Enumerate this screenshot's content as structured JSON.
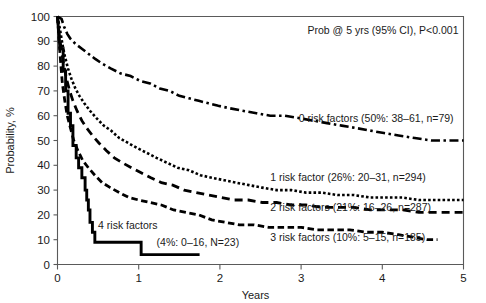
{
  "chart_data": {
    "type": "line",
    "title": "",
    "subtitle": "",
    "annotation_header": "Prob @ 5 yrs (95% CI), P<0.001",
    "xlabel": "Years",
    "ylabel": "Probability, %",
    "xlim": [
      0,
      5
    ],
    "ylim": [
      0,
      100
    ],
    "xticks": [
      "0",
      "1",
      "2",
      "3",
      "4",
      "5"
    ],
    "xtick_values": [
      0,
      1,
      2,
      3,
      4,
      5
    ],
    "yticks": [
      "0",
      "10",
      "20",
      "30",
      "40",
      "50",
      "60",
      "70",
      "80",
      "90",
      "100"
    ],
    "ytick_values": [
      0,
      10,
      20,
      30,
      40,
      50,
      60,
      70,
      80,
      90,
      100
    ],
    "grid": false,
    "legend_position": "inline-annotations",
    "series": [
      {
        "name": "0 risk factors",
        "label": "0 risk factors (50%: 38–61, n=79)",
        "prob_5yr": 50,
        "ci_low": 38,
        "ci_high": 61,
        "n": 79,
        "linestyle": "dashdot",
        "dasharray": "9,3.5,2.5,3.5",
        "linewidth": 2.6,
        "label_x": 2.97,
        "label_y": 57.5,
        "points": [
          [
            0.0,
            100
          ],
          [
            0.05,
            99
          ],
          [
            0.08,
            96
          ],
          [
            0.12,
            93
          ],
          [
            0.16,
            91
          ],
          [
            0.22,
            89
          ],
          [
            0.3,
            87
          ],
          [
            0.38,
            85
          ],
          [
            0.46,
            83
          ],
          [
            0.55,
            81
          ],
          [
            0.66,
            79
          ],
          [
            0.78,
            77
          ],
          [
            0.9,
            76
          ],
          [
            1.02,
            74
          ],
          [
            1.14,
            73
          ],
          [
            1.26,
            71
          ],
          [
            1.38,
            70
          ],
          [
            1.5,
            68
          ],
          [
            1.62,
            67
          ],
          [
            1.74,
            66
          ],
          [
            1.86,
            65
          ],
          [
            1.98,
            64
          ],
          [
            2.12,
            63
          ],
          [
            2.28,
            62
          ],
          [
            2.45,
            61
          ],
          [
            2.62,
            60
          ],
          [
            2.8,
            60
          ],
          [
            2.98,
            59
          ],
          [
            3.15,
            58
          ],
          [
            3.32,
            57
          ],
          [
            3.5,
            56
          ],
          [
            3.68,
            55
          ],
          [
            3.85,
            54
          ],
          [
            4.02,
            53
          ],
          [
            4.2,
            52
          ],
          [
            4.4,
            51
          ],
          [
            4.6,
            50
          ],
          [
            4.8,
            50
          ],
          [
            5.0,
            50
          ]
        ]
      },
      {
        "name": "1 risk factor",
        "label": "1 risk factor (26%: 20–31, n=294)",
        "prob_5yr": 26,
        "ci_low": 20,
        "ci_high": 31,
        "n": 294,
        "linestyle": "dotted",
        "dasharray": "2.6,2.2",
        "linewidth": 2.6,
        "label_x": 2.62,
        "label_y": 33.5,
        "points": [
          [
            0.0,
            100
          ],
          [
            0.03,
            95
          ],
          [
            0.06,
            89
          ],
          [
            0.09,
            84
          ],
          [
            0.13,
            79
          ],
          [
            0.17,
            75
          ],
          [
            0.22,
            71
          ],
          [
            0.27,
            68
          ],
          [
            0.33,
            65
          ],
          [
            0.4,
            62
          ],
          [
            0.48,
            59
          ],
          [
            0.57,
            56
          ],
          [
            0.66,
            54
          ],
          [
            0.76,
            51
          ],
          [
            0.87,
            49
          ],
          [
            0.98,
            47
          ],
          [
            1.1,
            45
          ],
          [
            1.22,
            43
          ],
          [
            1.35,
            41
          ],
          [
            1.48,
            39
          ],
          [
            1.62,
            38
          ],
          [
            1.76,
            36
          ],
          [
            1.9,
            35
          ],
          [
            2.05,
            34
          ],
          [
            2.2,
            33
          ],
          [
            2.36,
            32
          ],
          [
            2.52,
            31
          ],
          [
            2.7,
            30
          ],
          [
            2.88,
            30
          ],
          [
            3.06,
            29
          ],
          [
            3.25,
            29
          ],
          [
            3.45,
            28
          ],
          [
            3.65,
            28
          ],
          [
            3.85,
            27
          ],
          [
            4.05,
            27
          ],
          [
            4.25,
            27
          ],
          [
            4.45,
            26
          ],
          [
            4.65,
            26
          ],
          [
            4.85,
            26
          ],
          [
            5.0,
            26
          ]
        ]
      },
      {
        "name": "2 risk factors",
        "label": "2 risk factors (21%: 16–26, n=287)",
        "prob_5yr": 21,
        "ci_low": 16,
        "ci_high": 26,
        "n": 287,
        "linestyle": "dashed-long",
        "dasharray": "8,5",
        "linewidth": 2.8,
        "label_x": 2.62,
        "label_y": 21.5,
        "points": [
          [
            0.0,
            100
          ],
          [
            0.02,
            93
          ],
          [
            0.05,
            86
          ],
          [
            0.08,
            80
          ],
          [
            0.11,
            75
          ],
          [
            0.15,
            70
          ],
          [
            0.19,
            66
          ],
          [
            0.24,
            62
          ],
          [
            0.3,
            58
          ],
          [
            0.36,
            55
          ],
          [
            0.43,
            52
          ],
          [
            0.51,
            49
          ],
          [
            0.6,
            46
          ],
          [
            0.7,
            43
          ],
          [
            0.8,
            41
          ],
          [
            0.91,
            39
          ],
          [
            1.03,
            37
          ],
          [
            1.15,
            35
          ],
          [
            1.28,
            33
          ],
          [
            1.42,
            32
          ],
          [
            1.56,
            30
          ],
          [
            1.71,
            29
          ],
          [
            1.86,
            28
          ],
          [
            2.02,
            27
          ],
          [
            2.18,
            26
          ],
          [
            2.35,
            26
          ],
          [
            2.52,
            25
          ],
          [
            2.7,
            25
          ],
          [
            2.88,
            24
          ],
          [
            3.06,
            24
          ],
          [
            3.25,
            23
          ],
          [
            3.45,
            23
          ],
          [
            3.65,
            23
          ],
          [
            3.85,
            22
          ],
          [
            4.05,
            22
          ],
          [
            4.25,
            22
          ],
          [
            4.45,
            21
          ],
          [
            4.65,
            21
          ],
          [
            4.85,
            21
          ],
          [
            5.0,
            21
          ]
        ]
      },
      {
        "name": "3 risk factors",
        "label": "3 risk factors (10%: 5–15, n=185)",
        "prob_5yr": 10,
        "ci_low": 5,
        "ci_high": 15,
        "n": 185,
        "linestyle": "dashed-medium",
        "dasharray": "6.5,3.5",
        "linewidth": 2.8,
        "label_x": 2.62,
        "label_y": 9.5,
        "points": [
          [
            0.0,
            100
          ],
          [
            0.02,
            90
          ],
          [
            0.04,
            81
          ],
          [
            0.06,
            73
          ],
          [
            0.09,
            66
          ],
          [
            0.12,
            60
          ],
          [
            0.16,
            55
          ],
          [
            0.2,
            50
          ],
          [
            0.25,
            46
          ],
          [
            0.31,
            42
          ],
          [
            0.38,
            39
          ],
          [
            0.46,
            36
          ],
          [
            0.55,
            33
          ],
          [
            0.65,
            31
          ],
          [
            0.76,
            29
          ],
          [
            0.88,
            27
          ],
          [
            1.0,
            26
          ],
          [
            1.14,
            25
          ],
          [
            1.28,
            24
          ],
          [
            1.43,
            22
          ],
          [
            1.58,
            21
          ],
          [
            1.74,
            20
          ],
          [
            1.9,
            18
          ],
          [
            2.07,
            17
          ],
          [
            2.24,
            16
          ],
          [
            2.42,
            16
          ],
          [
            2.6,
            15
          ],
          [
            2.8,
            15
          ],
          [
            3.0,
            15
          ],
          [
            3.2,
            14
          ],
          [
            3.4,
            14
          ],
          [
            3.6,
            14
          ],
          [
            3.8,
            13
          ],
          [
            4.0,
            13
          ],
          [
            4.2,
            12
          ],
          [
            4.38,
            11
          ],
          [
            4.55,
            10
          ],
          [
            4.68,
            10
          ]
        ]
      },
      {
        "name": "4 risk factors",
        "label": "4 risk factors",
        "label_secondary": "(4%: 0–16, N=23)",
        "prob_5yr": 4,
        "ci_low": 0,
        "ci_high": 16,
        "n": 23,
        "linestyle": "solid",
        "dasharray": "",
        "linewidth": 2.9,
        "label_x": 0.5,
        "label_y": 14.5,
        "label_secondary_x": 1.22,
        "label_secondary_y": 7.5,
        "points": [
          [
            0.0,
            100
          ],
          [
            0.03,
            87
          ],
          [
            0.07,
            87
          ],
          [
            0.07,
            78
          ],
          [
            0.1,
            78
          ],
          [
            0.1,
            70
          ],
          [
            0.13,
            70
          ],
          [
            0.13,
            61
          ],
          [
            0.16,
            61
          ],
          [
            0.16,
            56
          ],
          [
            0.19,
            56
          ],
          [
            0.19,
            48
          ],
          [
            0.23,
            48
          ],
          [
            0.23,
            43
          ],
          [
            0.26,
            43
          ],
          [
            0.26,
            39
          ],
          [
            0.3,
            39
          ],
          [
            0.3,
            35
          ],
          [
            0.34,
            35
          ],
          [
            0.34,
            30
          ],
          [
            0.36,
            30
          ],
          [
            0.36,
            26
          ],
          [
            0.38,
            26
          ],
          [
            0.38,
            22
          ],
          [
            0.4,
            22
          ],
          [
            0.4,
            17
          ],
          [
            0.43,
            17
          ],
          [
            0.43,
            13
          ],
          [
            0.46,
            13
          ],
          [
            0.46,
            9
          ],
          [
            1.03,
            9
          ],
          [
            1.03,
            4
          ],
          [
            1.75,
            4
          ]
        ]
      }
    ]
  }
}
